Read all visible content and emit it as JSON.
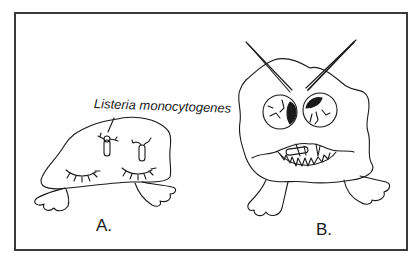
{
  "figure": {
    "annotation": "Listeria monocytogenes",
    "panels": [
      {
        "label": "A.",
        "description": "sleeping blob with two bacteria on its head, closed eyes"
      },
      {
        "label": "B.",
        "description": "angry blob with bloodshot eyes, furrowed brows, jagged teeth chewing a bacterium"
      }
    ],
    "colors": {
      "ink": "#1a1a1a",
      "border": "#3a3a3a",
      "background": "#ffffff"
    }
  }
}
